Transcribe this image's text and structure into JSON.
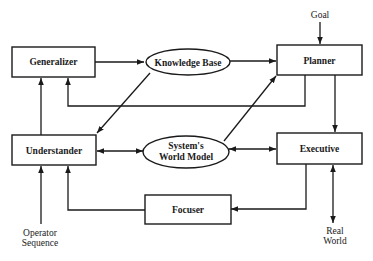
{
  "diagram": {
    "nodes": {
      "generalizer": {
        "label": "Generalizer",
        "shape": "rectangle"
      },
      "knowledge_base": {
        "label": "Knowledge Base",
        "shape": "ellipse"
      },
      "planner": {
        "label": "Planner",
        "shape": "rectangle"
      },
      "understander": {
        "label": "Understander",
        "shape": "rectangle"
      },
      "world_model": {
        "label_line1": "System's",
        "label_line2": "World Model",
        "shape": "ellipse"
      },
      "executive": {
        "label": "Executive",
        "shape": "rectangle"
      },
      "focuser": {
        "label": "Focuser",
        "shape": "rectangle"
      }
    },
    "external": {
      "goal": {
        "label": "Goal"
      },
      "operator_sequence": {
        "label_line1": "Operator",
        "label_line2": "Sequence"
      },
      "real_world": {
        "label_line1": "Real",
        "label_line2": "World"
      }
    },
    "edges": [
      {
        "from": "Generalizer",
        "to": "Knowledge Base"
      },
      {
        "from": "Knowledge Base",
        "to": "Planner"
      },
      {
        "from": "Knowledge Base",
        "to": "Understander"
      },
      {
        "from": "Planner",
        "to": "Generalizer"
      },
      {
        "from": "Goal",
        "to": "Planner"
      },
      {
        "from": "Planner",
        "to": "Executive"
      },
      {
        "from": "Understander",
        "to": "Generalizer"
      },
      {
        "from": "Understander",
        "to": "System's World Model",
        "bidirectional": true
      },
      {
        "from": "System's World Model",
        "to": "Planner"
      },
      {
        "from": "System's World Model",
        "to": "Executive",
        "bidirectional": true
      },
      {
        "from": "Executive",
        "to": "Focuser"
      },
      {
        "from": "Focuser",
        "to": "Understander"
      },
      {
        "from": "Operator Sequence",
        "to": "Understander"
      },
      {
        "from": "Executive",
        "to": "Real World",
        "bidirectional": true
      }
    ]
  }
}
